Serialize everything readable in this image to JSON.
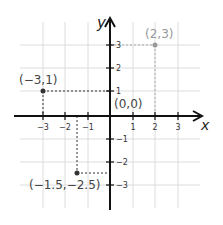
{
  "diagram": {
    "type": "coordinate-plane",
    "axes": {
      "x_label": "x",
      "y_label": "y",
      "x_ticks": [
        "−3",
        "−2",
        "−1",
        "1",
        "2",
        "3"
      ],
      "y_ticks": [
        "3",
        "2",
        "1",
        "−1",
        "−2",
        "−3"
      ]
    },
    "points": [
      {
        "label": "(2,3)",
        "x": 2,
        "y": 3,
        "color": "#999999"
      },
      {
        "label": "(−3,1)",
        "x": -3,
        "y": 1,
        "color": "#333333"
      },
      {
        "label": "(0,0)",
        "x": 0,
        "y": 0,
        "color": "#333333"
      },
      {
        "label": "(−1.5,−2.5)",
        "x": -1.5,
        "y": -2.5,
        "color": "#333333"
      }
    ],
    "colors": {
      "axis": "#111111",
      "grid": "#d8d8d8",
      "label": "#444444",
      "faded_point": "#999999"
    }
  }
}
